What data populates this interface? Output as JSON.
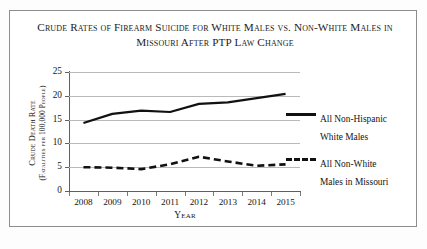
{
  "chart_data": {
    "type": "line",
    "title": "Crude Rates of Firearm Suicide for White Males vs. Non-White Males in Missouri After PTP Law Change",
    "title_line1": "Crude Rates of Firearm Suicide for White Males vs. Non-White",
    "title_line2": "Males in Missouri After PTP Law Change",
    "xlabel": "Year",
    "ylabel": "Crude Death Rate (Fatalities per 100,000 People)",
    "ylabel_line1": "Crude Death Rate",
    "ylabel_line2": "(Fatalities per 100,000 People)",
    "categories": [
      "2008",
      "2009",
      "2010",
      "2011",
      "2012",
      "2013",
      "2014",
      "2015"
    ],
    "ylim": [
      0,
      25
    ],
    "yticks": [
      "0",
      "5",
      "10",
      "15",
      "20",
      "25"
    ],
    "grid": true,
    "legend_position": "right",
    "series": [
      {
        "name": "All Non-Hispanic White Males",
        "name_line1": "All Non-Hispanic",
        "name_line2": "White Males",
        "style": "solid",
        "color": "#111111",
        "values": [
          14.3,
          16.2,
          16.9,
          16.6,
          18.3,
          18.6,
          19.5,
          20.4
        ]
      },
      {
        "name": "All Non-White Males in Missouri",
        "name_line1": "All Non-White",
        "name_line2": "Males in Missouri",
        "style": "dashed",
        "color": "#111111",
        "values": [
          5.0,
          4.9,
          4.6,
          5.6,
          7.2,
          6.2,
          5.3,
          5.6
        ]
      }
    ]
  }
}
